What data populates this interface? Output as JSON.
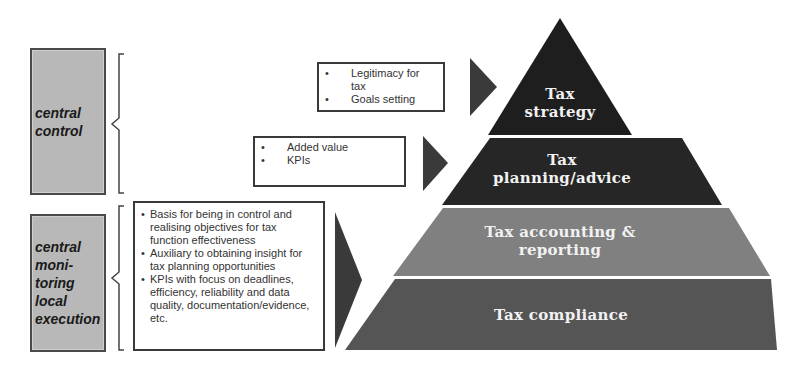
{
  "left_labels": [
    {
      "id": "central-control",
      "text": "central\ncontrol"
    },
    {
      "id": "central-monitoring",
      "text": "central\nmoni-\ntoring\nlocal\nexecution"
    }
  ],
  "notes": {
    "strategy": {
      "bullet": "•",
      "items": [
        "Legitimacy for tax",
        "Goals setting"
      ]
    },
    "planning": {
      "bullet": "•",
      "items": [
        "Added value",
        "KPIs"
      ]
    },
    "operational": {
      "bullet": "•",
      "items": [
        "Basis for being in control and realising objectives for tax function effectiveness",
        "Auxiliary to obtaining insight for tax planning opportunities",
        "KPIs with focus on deadlines, efficiency, reliability and data quality, documentation/evidence, etc."
      ]
    }
  },
  "pyramid": {
    "tiers": [
      {
        "label": "Tax\nstrategy",
        "color": "#1e1e1e"
      },
      {
        "label": "Tax\nplanning/advice",
        "color": "#262626"
      },
      {
        "label": "Tax accounting &\nreporting",
        "color": "#808080"
      },
      {
        "label": "Tax compliance",
        "color": "#555555"
      }
    ]
  },
  "colors": {
    "label_box": "#b8b8b8",
    "arrow": "#3a3a3a",
    "bracket": "#444444"
  }
}
